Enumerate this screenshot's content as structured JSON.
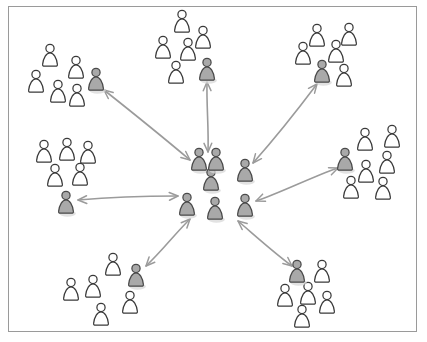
{
  "diagram": {
    "title": "Hub-and-spoke social network diagram",
    "canvas": {
      "width": 427,
      "height": 342,
      "background": "#ffffff"
    },
    "frame": {
      "x": 8,
      "y": 6,
      "width": 409,
      "height": 326,
      "stroke": "#9a9a9a",
      "stroke_width": 1
    },
    "colors": {
      "person_plain_fill": "#ffffff",
      "person_plain_stroke": "#3a3a3a",
      "person_shaded_fill": "#a9a9a9",
      "person_shaded_stroke": "#4a4a4a",
      "arrow_stroke": "#9b9b9b",
      "shadow": "#d8d8d8",
      "frame_stroke": "#9a9a9a"
    },
    "person_icon": "person-icon",
    "arrow_icon": "double-headed-arrow-icon",
    "counts": {
      "clusters_total": 8,
      "core_clusters": 1,
      "peripheral_clusters": 7,
      "shaded_people": 14,
      "plain_people": 40,
      "arrows": 7
    },
    "clusters": [
      {
        "id": "core",
        "name": "core-cluster",
        "role": "hub",
        "center": {
          "x": 221,
          "y": 184
        },
        "plain_count": 0,
        "shaded_count": 7,
        "people": [
          {
            "type": "shaded",
            "x": 199,
            "y": 160,
            "scale": 1.0
          },
          {
            "type": "shaded",
            "x": 245,
            "y": 171,
            "scale": 1.0
          },
          {
            "type": "shaded",
            "x": 211,
            "y": 180,
            "scale": 1.0
          },
          {
            "type": "shaded",
            "x": 245,
            "y": 206,
            "scale": 1.0
          },
          {
            "type": "shaded",
            "x": 187,
            "y": 205,
            "scale": 1.0
          },
          {
            "type": "shaded",
            "x": 215,
            "y": 209,
            "scale": 1.0
          },
          {
            "type": "shaded",
            "x": 216,
            "y": 160,
            "scale": 1.0
          }
        ]
      },
      {
        "id": "top-left",
        "name": "top-left-cluster",
        "role": "community",
        "center": {
          "x": 68,
          "y": 78
        },
        "plain_count": 5,
        "shaded_count": 1,
        "people": [
          {
            "type": "plain",
            "x": 50,
            "y": 56,
            "scale": 1.0
          },
          {
            "type": "plain",
            "x": 76,
            "y": 68,
            "scale": 1.0
          },
          {
            "type": "plain",
            "x": 36,
            "y": 82,
            "scale": 1.0
          },
          {
            "type": "plain",
            "x": 58,
            "y": 92,
            "scale": 1.0
          },
          {
            "type": "plain",
            "x": 77,
            "y": 96,
            "scale": 1.0
          },
          {
            "type": "shaded",
            "x": 96,
            "y": 80,
            "scale": 1.0
          }
        ]
      },
      {
        "id": "top-middle",
        "name": "top-middle-cluster",
        "role": "community",
        "center": {
          "x": 190,
          "y": 48
        },
        "plain_count": 6,
        "shaded_count": 1,
        "people": [
          {
            "type": "plain",
            "x": 182,
            "y": 22,
            "scale": 1.0
          },
          {
            "type": "plain",
            "x": 203,
            "y": 38,
            "scale": 1.0
          },
          {
            "type": "plain",
            "x": 163,
            "y": 48,
            "scale": 1.0
          },
          {
            "type": "plain",
            "x": 188,
            "y": 50,
            "scale": 1.0
          },
          {
            "type": "plain",
            "x": 176,
            "y": 73,
            "scale": 1.0
          },
          {
            "type": "shaded",
            "x": 207,
            "y": 70,
            "scale": 1.0
          }
        ]
      },
      {
        "id": "top-right",
        "name": "top-right-cluster",
        "role": "community",
        "center": {
          "x": 330,
          "y": 52
        },
        "plain_count": 5,
        "shaded_count": 1,
        "people": [
          {
            "type": "plain",
            "x": 317,
            "y": 36,
            "scale": 1.0
          },
          {
            "type": "plain",
            "x": 349,
            "y": 35,
            "scale": 1.0
          },
          {
            "type": "plain",
            "x": 303,
            "y": 54,
            "scale": 1.0
          },
          {
            "type": "plain",
            "x": 336,
            "y": 52,
            "scale": 1.0
          },
          {
            "type": "plain",
            "x": 344,
            "y": 76,
            "scale": 1.0
          },
          {
            "type": "shaded",
            "x": 322,
            "y": 72,
            "scale": 1.0
          }
        ]
      },
      {
        "id": "right",
        "name": "right-cluster",
        "role": "community",
        "center": {
          "x": 375,
          "y": 160
        },
        "plain_count": 6,
        "shaded_count": 1,
        "people": [
          {
            "type": "plain",
            "x": 365,
            "y": 140,
            "scale": 1.0
          },
          {
            "type": "plain",
            "x": 392,
            "y": 137,
            "scale": 1.0
          },
          {
            "type": "plain",
            "x": 387,
            "y": 163,
            "scale": 1.0
          },
          {
            "type": "plain",
            "x": 366,
            "y": 172,
            "scale": 1.0
          },
          {
            "type": "plain",
            "x": 351,
            "y": 188,
            "scale": 1.0
          },
          {
            "type": "plain",
            "x": 383,
            "y": 189,
            "scale": 1.0
          },
          {
            "type": "shaded",
            "x": 345,
            "y": 160,
            "scale": 1.0
          }
        ]
      },
      {
        "id": "left",
        "name": "left-cluster",
        "role": "community",
        "center": {
          "x": 68,
          "y": 172
        },
        "plain_count": 5,
        "shaded_count": 1,
        "people": [
          {
            "type": "plain",
            "x": 44,
            "y": 152,
            "scale": 1.0
          },
          {
            "type": "plain",
            "x": 67,
            "y": 150,
            "scale": 1.0
          },
          {
            "type": "plain",
            "x": 88,
            "y": 153,
            "scale": 1.0
          },
          {
            "type": "plain",
            "x": 55,
            "y": 176,
            "scale": 1.0
          },
          {
            "type": "plain",
            "x": 80,
            "y": 175,
            "scale": 1.0
          },
          {
            "type": "shaded",
            "x": 66,
            "y": 203,
            "scale": 1.0
          }
        ]
      },
      {
        "id": "bottom-left",
        "name": "bottom-left-cluster",
        "role": "community",
        "center": {
          "x": 112,
          "y": 289
        },
        "plain_count": 6,
        "shaded_count": 1,
        "people": [
          {
            "type": "plain",
            "x": 113,
            "y": 265,
            "scale": 1.0
          },
          {
            "type": "plain",
            "x": 93,
            "y": 287,
            "scale": 1.0
          },
          {
            "type": "plain",
            "x": 71,
            "y": 290,
            "scale": 1.0
          },
          {
            "type": "plain",
            "x": 130,
            "y": 303,
            "scale": 1.0
          },
          {
            "type": "plain",
            "x": 101,
            "y": 315,
            "scale": 1.0
          },
          {
            "type": "shaded",
            "x": 136,
            "y": 276,
            "scale": 1.0
          }
        ]
      },
      {
        "id": "bottom-right",
        "name": "bottom-right-cluster",
        "role": "community",
        "center": {
          "x": 305,
          "y": 292
        },
        "plain_count": 6,
        "shaded_count": 1,
        "people": [
          {
            "type": "plain",
            "x": 322,
            "y": 272,
            "scale": 1.0
          },
          {
            "type": "plain",
            "x": 285,
            "y": 296,
            "scale": 1.0
          },
          {
            "type": "plain",
            "x": 308,
            "y": 294,
            "scale": 1.0
          },
          {
            "type": "plain",
            "x": 327,
            "y": 303,
            "scale": 1.0
          },
          {
            "type": "plain",
            "x": 302,
            "y": 317,
            "scale": 1.0
          },
          {
            "type": "shaded",
            "x": 297,
            "y": 272,
            "scale": 1.0
          }
        ]
      }
    ],
    "connections": [
      {
        "id": "core-to-top-left",
        "name": "connection-core-top-left",
        "from": "core",
        "to": "top-left",
        "x1": 190,
        "y1": 160,
        "x2": 104,
        "y2": 90,
        "heads": "both"
      },
      {
        "id": "core-to-top-middle",
        "name": "connection-core-top-middle",
        "from": "core",
        "to": "top-middle",
        "x1": 208,
        "y1": 152,
        "x2": 207,
        "y2": 82,
        "heads": "both"
      },
      {
        "id": "core-to-top-right",
        "name": "connection-core-top-right",
        "from": "core",
        "to": "top-right",
        "x1": 253,
        "y1": 163,
        "x2": 317,
        "y2": 84,
        "heads": "both"
      },
      {
        "id": "core-to-right",
        "name": "connection-core-right",
        "from": "core",
        "to": "right",
        "x1": 256,
        "y1": 201,
        "x2": 338,
        "y2": 168,
        "heads": "both"
      },
      {
        "id": "core-to-left",
        "name": "connection-core-left",
        "from": "core",
        "to": "left",
        "x1": 178,
        "y1": 196,
        "x2": 78,
        "y2": 200,
        "heads": "both"
      },
      {
        "id": "core-to-bottom-left",
        "name": "connection-core-bottom-left",
        "from": "core",
        "to": "bottom-left",
        "x1": 190,
        "y1": 219,
        "x2": 146,
        "y2": 266,
        "heads": "both"
      },
      {
        "id": "core-to-bottom-right",
        "name": "connection-core-bottom-right",
        "from": "core",
        "to": "bottom-right",
        "x1": 238,
        "y1": 221,
        "x2": 292,
        "y2": 266,
        "heads": "both"
      }
    ]
  }
}
